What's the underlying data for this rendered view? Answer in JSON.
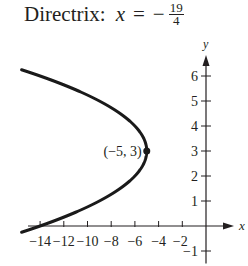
{
  "header": {
    "label": "Directrix:",
    "variable": "x",
    "equals": "=",
    "sign": "−",
    "numerator": "19",
    "denominator": "4"
  },
  "chart_data": {
    "type": "line",
    "xlabel": "x",
    "ylabel": "y",
    "xlim": [
      -15,
      0
    ],
    "ylim": [
      -1.3,
      6.8
    ],
    "x_ticks": [
      -14,
      -12,
      -10,
      -8,
      -6,
      -4,
      -2
    ],
    "x_tick_labels": [
      "−14",
      "−12",
      "−10",
      "−8",
      "−6",
      "−4",
      "−2"
    ],
    "y_ticks": [
      -1,
      1,
      2,
      3,
      4,
      5,
      6
    ],
    "y_tick_labels": [
      "−1",
      "1",
      "2",
      "3",
      "4",
      "5",
      "6"
    ],
    "grid": false,
    "series": [
      {
        "name": "parabola (y−3)² = −(x+5)",
        "x": [
          -15.3,
          -14,
          -11.25,
          -9,
          -6,
          -5,
          -6,
          -9,
          -11.25,
          -14,
          -15.3
        ],
        "y": [
          6.2,
          6,
          5.5,
          5,
          4,
          3,
          2,
          1,
          0.5,
          0,
          -0.2
        ]
      }
    ],
    "annotations": [
      {
        "text": "(−5, 3)",
        "x": -5,
        "y": 3,
        "marker": "point"
      }
    ]
  }
}
